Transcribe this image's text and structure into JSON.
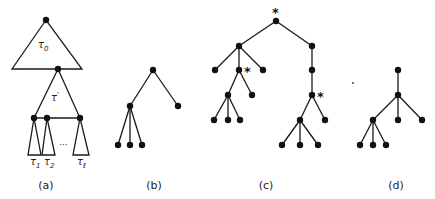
{
  "figure": {
    "panels": [
      {
        "id": "a",
        "caption": "(a)",
        "labels": {
          "top_triangle": "τ",
          "top_triangle_sub": "0",
          "mid_triangle": "τ",
          "mid_triangle_sup": "'",
          "sub_trees": [
            {
              "symbol": "τ",
              "sub": "1"
            },
            {
              "symbol": "τ",
              "sub": "2"
            },
            {
              "symbol": "τ",
              "sub": "ℓ"
            }
          ],
          "ellipsis": "···"
        }
      },
      {
        "id": "b",
        "caption": "(b)",
        "tree": {
          "children": [
            {
              "children": [
                {},
                {},
                {}
              ]
            },
            {}
          ]
        }
      },
      {
        "id": "c",
        "caption": "(c)",
        "marker": "*",
        "tree": {
          "marked": true,
          "children": [
            {
              "children": [
                {},
                {
                  "marked": true,
                  "children": [
                    {
                      "children": [
                        {},
                        {},
                        {}
                      ]
                    },
                    {}
                  ]
                },
                {}
              ]
            },
            {
              "children": [
                {
                  "children": [
                    {
                      "marked": true,
                      "children": [
                        {
                          "children": [
                            {},
                            {},
                            {}
                          ]
                        },
                        {}
                      ]
                    }
                  ]
                }
              ]
            }
          ]
        }
      },
      {
        "id": "d",
        "caption": "(d)",
        "tree": {
          "children": [
            {
              "children": [
                {
                  "children": [
                    {},
                    {},
                    {}
                  ]
                },
                {},
                {}
              ]
            }
          ]
        }
      }
    ]
  }
}
